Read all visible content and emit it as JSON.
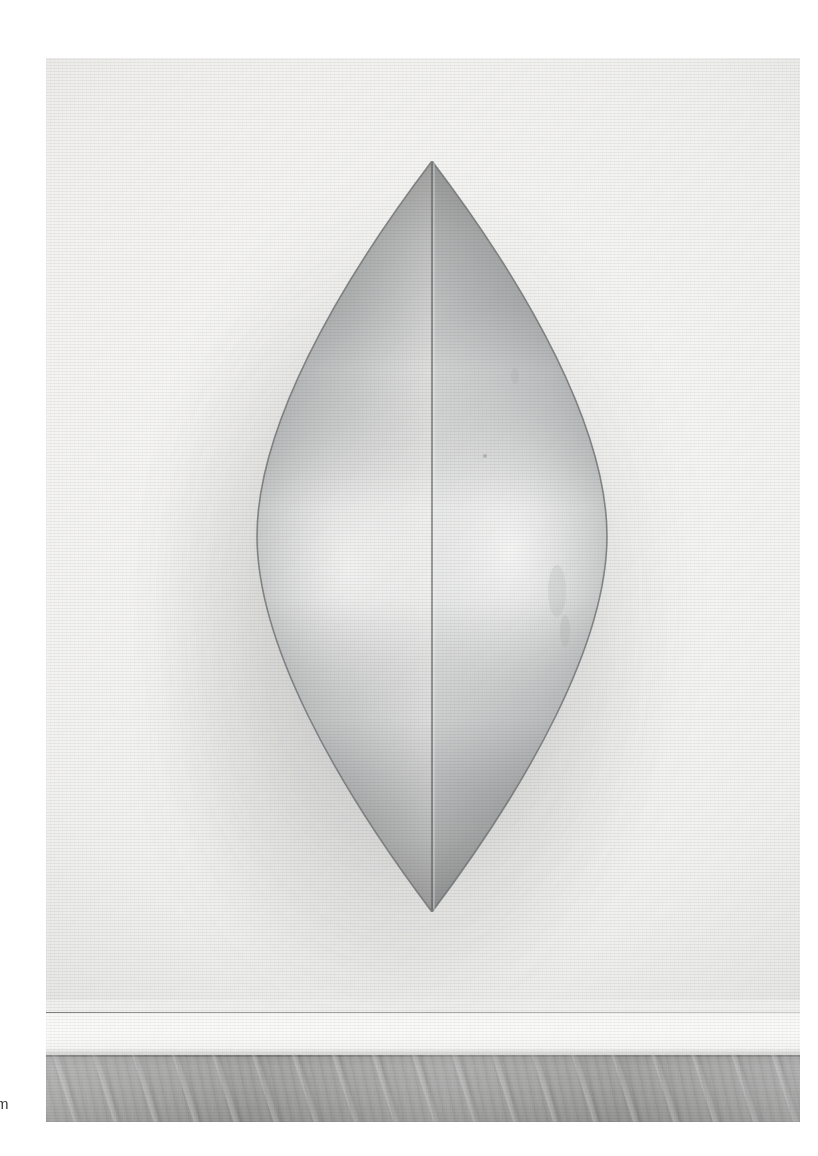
{
  "page": {
    "kind": "scanned-catalogue-plate",
    "background_color": "#ffffff",
    "width": 818,
    "height": 1156
  },
  "caption": {
    "fragment_text": "m",
    "note": "single letter clipped by the left page margin"
  },
  "plate": {
    "name": "photographic-plate",
    "x": 46,
    "y": 58,
    "width": 754,
    "height": 1064,
    "subject": "lens-shaped wall-mounted sculpture in gallery interior",
    "palette": {
      "paper_white": "#ffffff",
      "wall_light": "#fbfbfa",
      "wall_mid": "#f2f2f1",
      "shadow_halo": "#5a5c5f",
      "sculpture_light": "#fdfdfd",
      "sculpture_mid": "#c8c9ca",
      "sculpture_dark": "#9a9c9e",
      "sculpture_edge": "#6f7173",
      "seam_line": "#5f6163",
      "floor_mid": "#a2a2a2",
      "floor_dark": "#8d8d8d",
      "panel_seam": "#8d8d8d"
    }
  },
  "sculpture": {
    "name": "vesica-lens-relief",
    "form": "vertical pointed oval (vesica piscis) formed by two convex shells",
    "apex_top": {
      "x": 412,
      "y": 161
    },
    "apex_bottom": {
      "x": 408,
      "y": 910
    },
    "left_extreme_x": 186,
    "right_extreme_x": 633,
    "center_seam_x": 410,
    "height_px": 749,
    "width_px": 447,
    "halves": [
      {
        "name": "left-shell",
        "tone": "darker, graded from dark edge to bright band at x≈305"
      },
      {
        "name": "right-shell",
        "tone": "lighter, bright band at x≈470, darkening toward right edge"
      }
    ],
    "highlights": [
      {
        "name": "left-highlight-band",
        "center_x": 308,
        "center_y": 560
      },
      {
        "name": "right-highlight-band",
        "center_x": 472,
        "center_y": 545
      }
    ]
  },
  "room": {
    "wall": {
      "name": "gallery-wall",
      "tone": "near-white",
      "bottom_y": 1000
    },
    "panel_seam": {
      "name": "wall-panel-seam",
      "y": 1012
    },
    "skirting": {
      "name": "skirting-band",
      "y": 1013,
      "height": 42
    },
    "floor": {
      "name": "wood-floor",
      "top_y": 1055,
      "bottom_y": 1122,
      "material": "grey stained wood planks",
      "plank_direction": "diagonal, receding to the right"
    }
  }
}
